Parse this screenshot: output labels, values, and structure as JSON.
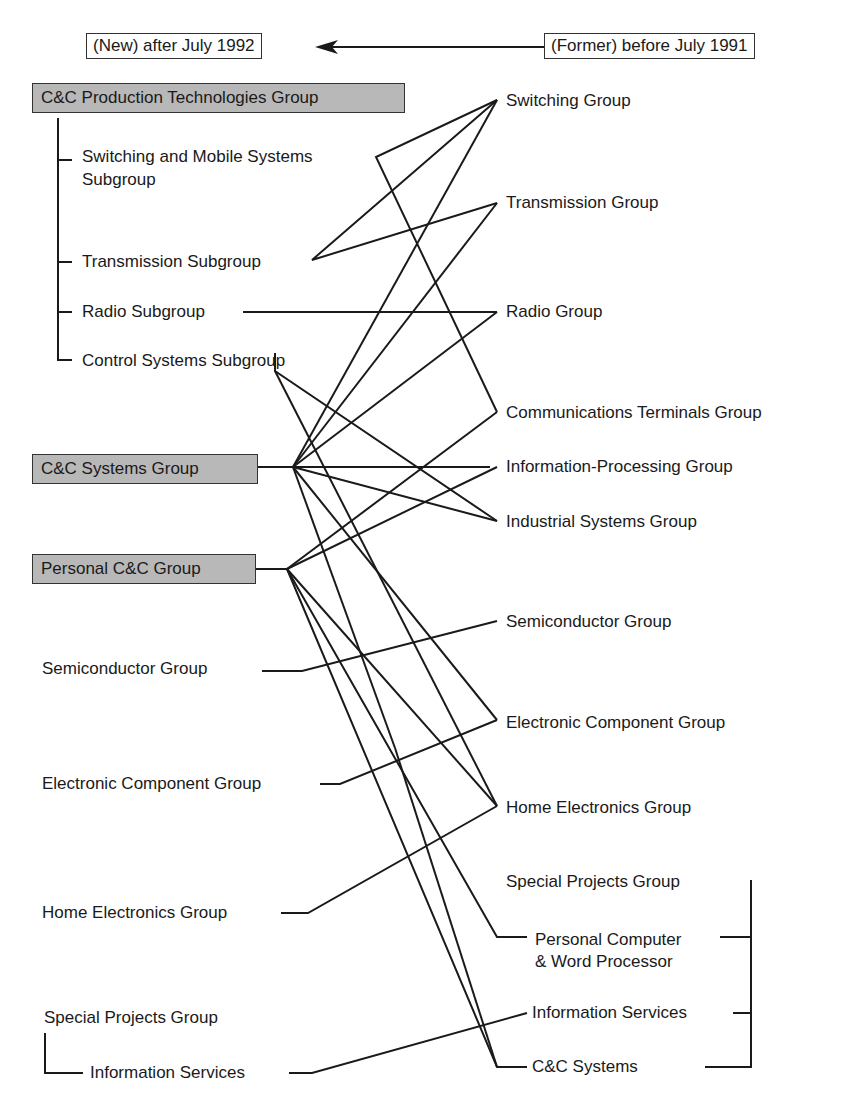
{
  "legend": {
    "new_label": "(New) after July 1992",
    "former_label": "(Former) before July 1991",
    "arrow": "arrow-left-icon"
  },
  "new_structure": {
    "production_group": "C&C Production Technologies Group",
    "production_subgroups": [
      "Switching and Mobile Systems",
      "Subgroup",
      "Transmission Subgroup",
      "Radio Subgroup",
      "Control Systems Subgroup"
    ],
    "systems_group": "C&C Systems Group",
    "personal_group": "Personal C&C Group",
    "semiconductor": "Semiconductor Group",
    "electronic_component": "Electronic Component Group",
    "home_electronics": "Home Electronics Group",
    "special_projects": "Special Projects Group",
    "information_services": "Information Services"
  },
  "former_structure": {
    "switching": "Switching Group",
    "transmission": "Transmission Group",
    "radio": "Radio Group",
    "comm_terminals": "Communications Terminals Group",
    "info_processing": "Information-Processing Group",
    "industrial": "Industrial Systems Group",
    "semiconductor": "Semiconductor Group",
    "electronic_component": "Electronic Component Group",
    "home_electronics": "Home Electronics Group",
    "special_projects": "Special Projects Group",
    "pc_wp_line1": "Personal Computer",
    "pc_wp_line2": "& Word Processor",
    "information_services": "Information Services",
    "cc_systems": "C&C Systems"
  },
  "colors": {
    "group_box_fill": "#b8b8b8",
    "line": "#1a1a1a",
    "background": "#ffffff"
  }
}
